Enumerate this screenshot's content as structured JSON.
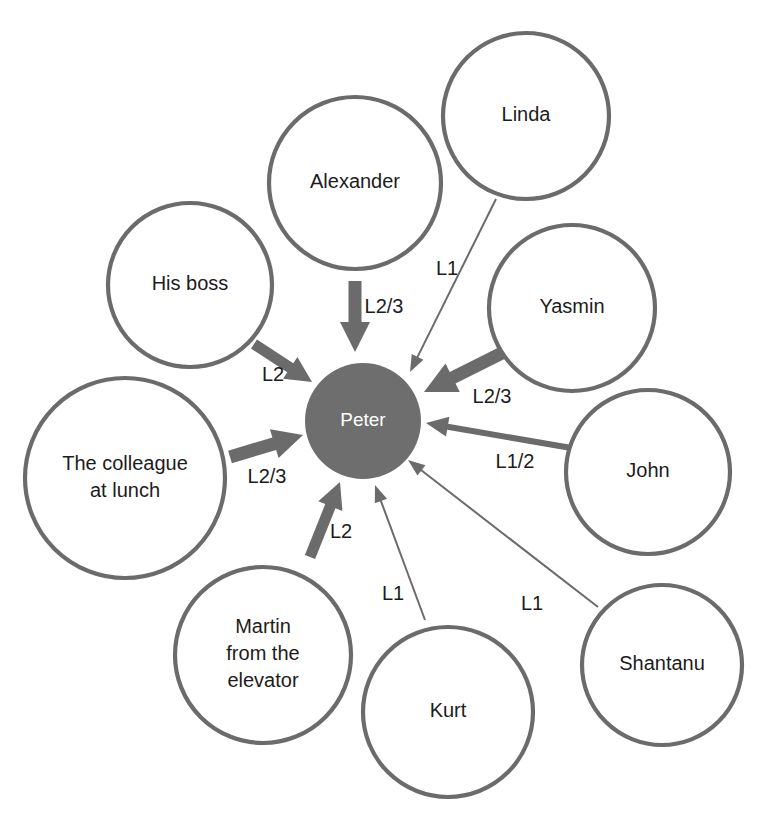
{
  "diagram": {
    "type": "network-influence-map",
    "center": {
      "id": "peter",
      "label": "Peter",
      "cx": 363,
      "cy": 421,
      "r": 58,
      "fill": "#6e6e6e",
      "text_color": "#ffffff"
    },
    "node_stroke": "#6b6b6b",
    "node_fill": "#ffffff",
    "text_color": "#1c1c1c",
    "nodes": [
      {
        "id": "alexander",
        "label": "Alexander",
        "lines": [
          "Alexander"
        ],
        "cx": 355,
        "cy": 183,
        "r": 86
      },
      {
        "id": "linda",
        "label": "Linda",
        "lines": [
          "Linda"
        ],
        "cx": 526,
        "cy": 116,
        "r": 83
      },
      {
        "id": "yasmin",
        "label": "Yasmin",
        "lines": [
          "Yasmin"
        ],
        "cx": 572,
        "cy": 308,
        "r": 83
      },
      {
        "id": "his-boss",
        "label": "His boss",
        "lines": [
          "His boss"
        ],
        "cx": 190,
        "cy": 285,
        "r": 82
      },
      {
        "id": "the-colleague-at-lunch",
        "label": "The colleague at lunch",
        "lines": [
          "The colleague",
          "at lunch"
        ],
        "cx": 125,
        "cy": 478,
        "r": 100
      },
      {
        "id": "martin-from-the-elevator",
        "label": "Martin from the elevator",
        "lines": [
          "Martin",
          "from the",
          "elevator"
        ],
        "cx": 263,
        "cy": 655,
        "r": 88
      },
      {
        "id": "kurt",
        "label": "Kurt",
        "lines": [
          "Kurt"
        ],
        "cx": 448,
        "cy": 712,
        "r": 85
      },
      {
        "id": "shantanu",
        "label": "Shantanu",
        "lines": [
          "Shantanu"
        ],
        "cx": 662,
        "cy": 665,
        "r": 80
      },
      {
        "id": "john",
        "label": "John",
        "lines": [
          "John"
        ],
        "cx": 648,
        "cy": 472,
        "r": 82
      }
    ],
    "edges": [
      {
        "id": "edge-alexander-peter",
        "from": "alexander",
        "to": "peter",
        "label": "L2/3",
        "weight": "thick",
        "label_x": 384,
        "label_y": 308,
        "x1": 355,
        "y1": 281,
        "x2": 355,
        "y2": 352,
        "shaft_width": 13,
        "head_width": 30,
        "head_length": 30
      },
      {
        "id": "edge-linda-peter",
        "from": "linda",
        "to": "peter",
        "label": "L1",
        "weight": "thin",
        "label_x": 447,
        "label_y": 270,
        "x1": 496,
        "y1": 199,
        "x2": 410,
        "y2": 372,
        "head_width": 13,
        "head_length": 17
      },
      {
        "id": "edge-yasmin-peter",
        "from": "yasmin",
        "to": "peter",
        "label": "L2/3",
        "weight": "thick",
        "label_x": 492,
        "label_y": 398,
        "x1": 514,
        "y1": 347,
        "x2": 424,
        "y2": 392,
        "shaft_width": 13,
        "head_width": 32,
        "head_length": 32
      },
      {
        "id": "edge-his-boss-peter",
        "from": "his-boss",
        "to": "peter",
        "label": "L2",
        "weight": "thick",
        "label_x": 273,
        "label_y": 376,
        "x1": 254,
        "y1": 344,
        "x2": 312,
        "y2": 382,
        "shaft_width": 11,
        "head_width": 26,
        "head_length": 26
      },
      {
        "id": "edge-colleague-peter",
        "from": "the-colleague-at-lunch",
        "to": "peter",
        "label": "L2/3",
        "weight": "thick",
        "label_x": 267,
        "label_y": 478,
        "x1": 230,
        "y1": 457,
        "x2": 303,
        "y2": 435,
        "shaft_width": 13,
        "head_width": 30,
        "head_length": 30
      },
      {
        "id": "edge-martin-peter",
        "from": "martin-from-the-elevator",
        "to": "peter",
        "label": "L2",
        "weight": "thick",
        "label_x": 341,
        "label_y": 533,
        "x1": 310,
        "y1": 557,
        "x2": 340,
        "y2": 482,
        "shaft_width": 11,
        "head_width": 26,
        "head_length": 26
      },
      {
        "id": "edge-kurt-peter",
        "from": "kurt",
        "to": "peter",
        "label": "L1",
        "weight": "thin",
        "label_x": 393,
        "label_y": 595,
        "x1": 425,
        "y1": 620,
        "x2": 375,
        "y2": 485,
        "head_width": 13,
        "head_length": 17
      },
      {
        "id": "edge-shantanu-peter",
        "from": "shantanu",
        "to": "peter",
        "label": "L1",
        "weight": "thin",
        "label_x": 532,
        "label_y": 605,
        "x1": 598,
        "y1": 607,
        "x2": 408,
        "y2": 460,
        "head_width": 13,
        "head_length": 17
      },
      {
        "id": "edge-john-peter",
        "from": "john",
        "to": "peter",
        "label": "L1/2",
        "weight": "medium",
        "label_x": 515,
        "label_y": 463,
        "x1": 583,
        "y1": 450,
        "x2": 426,
        "y2": 423,
        "shaft_width": 6,
        "head_width": 20,
        "head_length": 22
      }
    ]
  }
}
